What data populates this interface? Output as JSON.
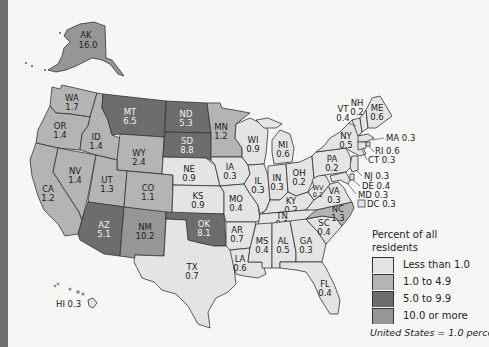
{
  "colors": {
    "less_than_1": "#e4e4e4",
    "1_to_4_9": "#b4b4b4",
    "5_to_9_9": "#6d6d6d",
    "10_or_more": "#969696",
    "background": "#f6f6f4",
    "left_bar": "#6e6e6e"
  },
  "legend": {
    "title_line1": "Percent of all",
    "title_line2": "residents",
    "items": [
      {
        "label": "Less than 1.0",
        "color": "#e4e4e4"
      },
      {
        "label": "1.0 to 4.9",
        "color": "#b4b4b4"
      },
      {
        "label": "5.0 to 9.9",
        "color": "#6d6d6d"
      },
      {
        "label": "10.0 or more",
        "color": "#969696"
      }
    ],
    "note": "United States = 1.0 percent"
  },
  "states": {
    "AK": {
      "abbr": "AK",
      "value": "16.0"
    },
    "HI": {
      "abbr": "HI",
      "value": "0.3",
      "text": "HI 0.3"
    },
    "WA": {
      "abbr": "WA",
      "value": "1.7"
    },
    "OR": {
      "abbr": "OR",
      "value": "1.4"
    },
    "CA": {
      "abbr": "CA",
      "value": "1.2"
    },
    "ID": {
      "abbr": "ID",
      "value": "1.4"
    },
    "NV": {
      "abbr": "NV",
      "value": "1.4"
    },
    "MT": {
      "abbr": "MT",
      "value": "6.5"
    },
    "WY": {
      "abbr": "WY",
      "value": "2.4"
    },
    "UT": {
      "abbr": "UT",
      "value": "1.3"
    },
    "CO": {
      "abbr": "CO",
      "value": "1.1"
    },
    "AZ": {
      "abbr": "AZ",
      "value": "5.1"
    },
    "NM": {
      "abbr": "NM",
      "value": "10.2"
    },
    "ND": {
      "abbr": "ND",
      "value": "5.3"
    },
    "SD": {
      "abbr": "SD",
      "value": "8.8"
    },
    "NE": {
      "abbr": "NE",
      "value": "0.9"
    },
    "KS": {
      "abbr": "KS",
      "value": "0.9"
    },
    "OK": {
      "abbr": "OK",
      "value": "8.1"
    },
    "TX": {
      "abbr": "TX",
      "value": "0.7"
    },
    "MN": {
      "abbr": "MN",
      "value": "1.2"
    },
    "IA": {
      "abbr": "IA",
      "value": "0.3"
    },
    "MO": {
      "abbr": "MO",
      "value": "0.4"
    },
    "AR": {
      "abbr": "AR",
      "value": "0.7"
    },
    "LA": {
      "abbr": "LA",
      "value": "0.6"
    },
    "WI": {
      "abbr": "WI",
      "value": "0.9"
    },
    "IL": {
      "abbr": "IL",
      "value": "0.3"
    },
    "MI": {
      "abbr": "MI",
      "value": "0.6"
    },
    "IN": {
      "abbr": "IN",
      "value": "0.3"
    },
    "OH": {
      "abbr": "OH",
      "value": "0.2"
    },
    "KY": {
      "abbr": "KY",
      "value": "0.2"
    },
    "TN": {
      "abbr": "TN",
      "value": "0.1"
    },
    "MS": {
      "abbr": "MS",
      "value": "0.4"
    },
    "AL": {
      "abbr": "AL",
      "value": "0.5"
    },
    "GA": {
      "abbr": "GA",
      "value": "0.3"
    },
    "FL": {
      "abbr": "FL",
      "value": "0.4"
    },
    "SC": {
      "abbr": "SC",
      "value": "0.4"
    },
    "NC": {
      "abbr": "NC",
      "value": "1.3"
    },
    "VA": {
      "abbr": "VA",
      "value": "0.3"
    },
    "WV": {
      "abbr": "WV",
      "value": "0.2"
    },
    "PA": {
      "abbr": "PA",
      "value": "0.2"
    },
    "NY": {
      "abbr": "NY",
      "value": "0.5"
    },
    "VT": {
      "abbr": "VT",
      "value": "0.4"
    },
    "NH": {
      "abbr": "NH",
      "value": "0.2"
    },
    "ME": {
      "abbr": "ME",
      "value": "0.6"
    },
    "MA": {
      "abbr": "MA",
      "value": "0.3",
      "text": "MA 0.3"
    },
    "RI": {
      "abbr": "RI",
      "value": "0.6",
      "text": "RI 0.6"
    },
    "CT": {
      "abbr": "CT",
      "value": "0.3",
      "text": "CT 0.3"
    },
    "NJ": {
      "abbr": "NJ",
      "value": "0.3",
      "text": "NJ 0.3"
    },
    "DE": {
      "abbr": "DE",
      "value": "0.4",
      "text": "DE 0.4"
    },
    "MD": {
      "abbr": "MD",
      "value": "0.3",
      "text": "MD 0.3"
    },
    "DC": {
      "abbr": "DC",
      "value": "0.3",
      "text": "DC 0.3"
    }
  }
}
